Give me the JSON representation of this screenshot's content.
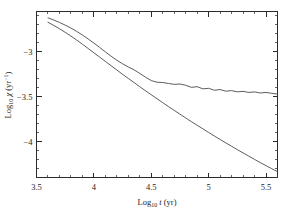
{
  "chart_data": {
    "type": "line",
    "title": "",
    "xlabel": "Log10 t (yr)",
    "ylabel": "Log10 chi (yr^-1)",
    "xlabel_parts": {
      "prefix": "Log",
      "sub": "10",
      "var": " t ",
      "unit": "(yr)"
    },
    "ylabel_parts": {
      "prefix": "Log",
      "sub": "10",
      "var": " χ ",
      "unit": "(yr",
      "sup": "−1",
      "unit_close": ")"
    },
    "xlim": [
      3.5,
      5.6
    ],
    "ylim": [
      -4.4,
      -2.55
    ],
    "xticks": [
      3.5,
      4,
      4.5,
      5,
      5.5
    ],
    "xtick_labels": [
      "3.5",
      "4",
      "4.5",
      "5",
      "5.5"
    ],
    "yticks": [
      -3,
      -3.5,
      -4
    ],
    "ytick_labels": [
      "−3",
      "−3.5",
      "−4"
    ],
    "x_minor_step": 0.1,
    "y_minor_step": 0.1,
    "grid": false,
    "legend": "none",
    "ticks_direction": "in",
    "frame": "box-all-sides",
    "series": [
      {
        "name": "upper-curve",
        "description": "Declines then flattens to a noisy plateau near Log10 chi = -3.47",
        "x": [
          3.6,
          3.65,
          3.7,
          3.75,
          3.8,
          3.85,
          3.9,
          3.95,
          4.0,
          4.05,
          4.1,
          4.15,
          4.2,
          4.25,
          4.3,
          4.35,
          4.4,
          4.45,
          4.5,
          4.55,
          4.6,
          4.65,
          4.7,
          4.75,
          4.8,
          4.85,
          4.9,
          4.95,
          5.0,
          5.05,
          5.1,
          5.15,
          5.2,
          5.25,
          5.3,
          5.35,
          5.4,
          5.45,
          5.5,
          5.55,
          5.6
        ],
        "y": [
          -2.62,
          -2.645,
          -2.672,
          -2.702,
          -2.735,
          -2.772,
          -2.812,
          -2.856,
          -2.902,
          -2.95,
          -3.0,
          -3.048,
          -3.093,
          -3.133,
          -3.168,
          -3.2,
          -3.24,
          -3.282,
          -3.32,
          -3.338,
          -3.342,
          -3.352,
          -3.362,
          -3.358,
          -3.372,
          -3.395,
          -3.388,
          -3.412,
          -3.406,
          -3.428,
          -3.42,
          -3.438,
          -3.432,
          -3.445,
          -3.44,
          -3.452,
          -3.446,
          -3.458,
          -3.452,
          -3.462,
          -3.47
        ]
      },
      {
        "name": "lower-curve",
        "description": "Steady power-law decline from -2.67 to about -4.33",
        "x": [
          3.6,
          3.65,
          3.7,
          3.75,
          3.8,
          3.85,
          3.9,
          3.95,
          4.0,
          4.05,
          4.1,
          4.15,
          4.2,
          4.25,
          4.3,
          4.35,
          4.4,
          4.45,
          4.5,
          4.55,
          4.6,
          4.65,
          4.7,
          4.75,
          4.8,
          4.85,
          4.9,
          4.95,
          5.0,
          5.05,
          5.1,
          5.15,
          5.2,
          5.25,
          5.3,
          5.35,
          5.4,
          5.45,
          5.5,
          5.55,
          5.6
        ],
        "y": [
          -2.67,
          -2.705,
          -2.742,
          -2.782,
          -2.824,
          -2.868,
          -2.914,
          -2.962,
          -3.01,
          -3.058,
          -3.106,
          -3.154,
          -3.202,
          -3.25,
          -3.296,
          -3.342,
          -3.388,
          -3.434,
          -3.478,
          -3.522,
          -3.566,
          -3.61,
          -3.652,
          -3.694,
          -3.736,
          -3.778,
          -3.818,
          -3.858,
          -3.898,
          -3.938,
          -3.976,
          -4.014,
          -4.052,
          -4.09,
          -4.126,
          -4.162,
          -4.198,
          -4.234,
          -4.268,
          -4.302,
          -4.334
        ]
      }
    ],
    "colors": {
      "axis": "#2b2b2b",
      "curve": "#4a4a4a",
      "background": "#ffffff",
      "text": "#1c1c1c"
    }
  }
}
